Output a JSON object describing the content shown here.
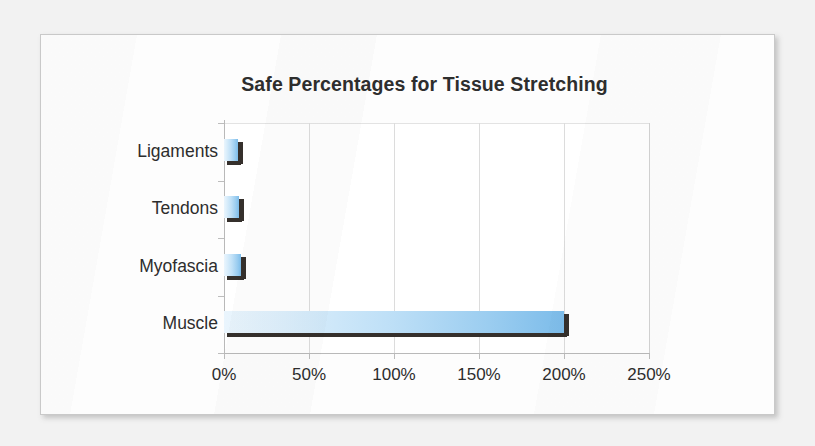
{
  "chart_data": {
    "type": "bar",
    "orientation": "horizontal",
    "title": "Safe Percentages for Tissue Stretching",
    "xlabel": "",
    "ylabel": "",
    "categories": [
      "Ligaments",
      "Tendons",
      "Myofascia",
      "Muscle"
    ],
    "values": [
      8,
      9,
      10,
      200
    ],
    "value_labels": [
      "8%",
      "9%",
      "10%",
      "200%"
    ],
    "xlim": [
      0,
      250
    ],
    "xticks": [
      0,
      50,
      100,
      150,
      200,
      250
    ],
    "xtick_labels": [
      "0%",
      "50%",
      "100%",
      "150%",
      "200%",
      "250%"
    ],
    "grid": "vertical",
    "legend": "none",
    "bar_fill_start": "#eaf5fd",
    "bar_fill_end": "#7cbcea",
    "bar_shadow_color": "#35302c",
    "title_color": "#2e2e2e",
    "axis_color": "#b9b9b9",
    "gridline_color": "#dcdcdc",
    "plot_background": "#ffffff"
  },
  "page": {
    "background": "#f2f2f2",
    "card_background": "#fdfdfd",
    "card_border": "#c9c9c9"
  }
}
